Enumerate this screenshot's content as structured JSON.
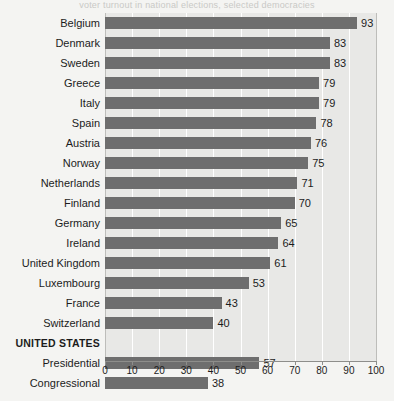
{
  "caption": {
    "clipped_text": "voter turnout in national elections, selected democracies"
  },
  "colors": {
    "bar": "#6e6e6e",
    "plot_background": "#e8e8e6",
    "page_background": "#f4f4f2",
    "gridline": "#ffffff",
    "axis": "#8e8e8b",
    "text": "#1c1c1c"
  },
  "chart_data": {
    "type": "bar",
    "orientation": "horizontal",
    "title": "",
    "xlabel": "",
    "ylabel": "",
    "xlim": [
      0,
      100
    ],
    "xticks": [
      0,
      10,
      20,
      30,
      40,
      50,
      60,
      70,
      80,
      90,
      100
    ],
    "grid": true,
    "legend": "none",
    "categories": [
      "Belgium",
      "Denmark",
      "Sweden",
      "Greece",
      "Italy",
      "Spain",
      "Austria",
      "Norway",
      "Netherlands",
      "Finland",
      "Germany",
      "Ireland",
      "United Kingdom",
      "Luxembourg",
      "France",
      "Switzerland",
      "UNITED STATES",
      "Presidential",
      "Congressional"
    ],
    "values": [
      93,
      83,
      83,
      79,
      79,
      78,
      76,
      75,
      71,
      70,
      65,
      64,
      61,
      53,
      43,
      40,
      null,
      57,
      38
    ],
    "rows": [
      {
        "label": "Belgium",
        "value": 93,
        "group_header": false
      },
      {
        "label": "Denmark",
        "value": 83,
        "group_header": false
      },
      {
        "label": "Sweden",
        "value": 83,
        "group_header": false
      },
      {
        "label": "Greece",
        "value": 79,
        "group_header": false
      },
      {
        "label": "Italy",
        "value": 79,
        "group_header": false
      },
      {
        "label": "Spain",
        "value": 78,
        "group_header": false
      },
      {
        "label": "Austria",
        "value": 76,
        "group_header": false
      },
      {
        "label": "Norway",
        "value": 75,
        "group_header": false
      },
      {
        "label": "Netherlands",
        "value": 71,
        "group_header": false
      },
      {
        "label": "Finland",
        "value": 70,
        "group_header": false
      },
      {
        "label": "Germany",
        "value": 65,
        "group_header": false
      },
      {
        "label": "Ireland",
        "value": 64,
        "group_header": false
      },
      {
        "label": "United Kingdom",
        "value": 61,
        "group_header": false
      },
      {
        "label": "Luxembourg",
        "value": 53,
        "group_header": false
      },
      {
        "label": "France",
        "value": 43,
        "group_header": false
      },
      {
        "label": "Switzerland",
        "value": 40,
        "group_header": false
      },
      {
        "label": "UNITED STATES",
        "value": null,
        "group_header": true
      },
      {
        "label": "Presidential",
        "value": 57,
        "group_header": false
      },
      {
        "label": "Congressional",
        "value": 38,
        "group_header": false
      }
    ]
  }
}
